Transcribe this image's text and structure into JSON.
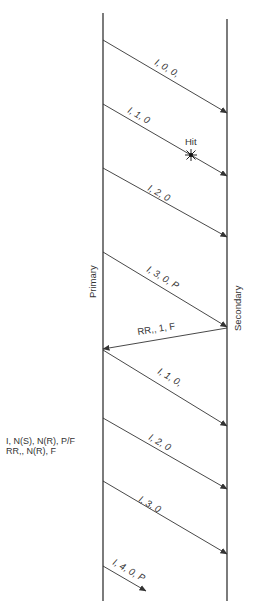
{
  "diagram": {
    "stations": {
      "primary": {
        "label": "Primary",
        "x": 103,
        "y_top": 13,
        "y_bottom": 601
      },
      "secondary": {
        "label": "Secondary",
        "x": 227,
        "y_top": 19,
        "y_bottom": 601
      }
    },
    "frames": [
      {
        "label": "I, 0, 0,",
        "from": "primary",
        "to": "secondary",
        "y_start": 40,
        "y_end": 113
      },
      {
        "label": "I, 1, 0",
        "from": "primary",
        "to": "secondary",
        "y_start": 104,
        "y_end": 176,
        "hit": true
      },
      {
        "label": "I, 2, 0",
        "from": "primary",
        "to": "secondary",
        "y_start": 168,
        "y_end": 237
      },
      {
        "label": "I, 3, 0, P",
        "from": "primary",
        "to": "secondary",
        "y_start": 252,
        "y_end": 327
      },
      {
        "label": "RR,, 1, F",
        "from": "secondary",
        "to": "primary",
        "y_start": 328,
        "y_end": 349
      },
      {
        "label": "I, 1, 0,",
        "from": "primary",
        "to": "secondary",
        "y_start": 350,
        "y_end": 426
      },
      {
        "label": "I, 2, 0",
        "from": "primary",
        "to": "secondary",
        "y_start": 418,
        "y_end": 489
      },
      {
        "label": "I, 3, 0",
        "from": "primary",
        "to": "secondary",
        "y_start": 481,
        "y_end": 554
      },
      {
        "label": "I, 4, 0, P",
        "from": "primary",
        "to": "partial",
        "y_start": 566,
        "y_end": 591
      }
    ],
    "hit_marker": {
      "label": "Hit",
      "x": 191,
      "y": 155
    },
    "legend": {
      "line1": "I, N(S), N(R), P/F",
      "line2": "RR,, N(R), F"
    },
    "colors": {
      "line": "#333333",
      "text": "#333333"
    }
  }
}
